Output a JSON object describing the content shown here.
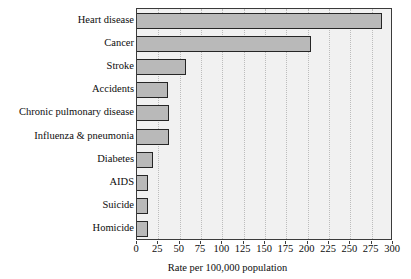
{
  "chart_data": {
    "type": "bar",
    "orientation": "horizontal",
    "title": "",
    "subtitle": "",
    "xlabel": "Rate per 100,000 population",
    "ylabel": "",
    "xlim": [
      0,
      300
    ],
    "ylim": null,
    "grid": "vertical-dotted",
    "legend": null,
    "xticks": [
      0,
      25,
      50,
      75,
      100,
      125,
      150,
      175,
      200,
      225,
      250,
      275,
      300
    ],
    "xtick_labels": [
      "0",
      "25",
      "50",
      "75",
      "100",
      "125",
      "150",
      "175",
      "200",
      "225",
      "250",
      "275",
      "300"
    ],
    "categories": [
      "Heart disease",
      "Cancer",
      "Stroke",
      "Accidents",
      "Chronic pulmonary disease",
      "Influenza & pneumonia",
      "Diabetes",
      "AIDS",
      "Suicide",
      "Homicide"
    ],
    "values": [
      287,
      204,
      58,
      36,
      38,
      37,
      19,
      13,
      13,
      13
    ],
    "bar_fill_color": "#b9b9b9",
    "bar_border_color": "#262626",
    "plot_background_color": "#f1f1f1",
    "gridline_color": "#bcbcbc",
    "axis_color": "#3b3b3b"
  }
}
